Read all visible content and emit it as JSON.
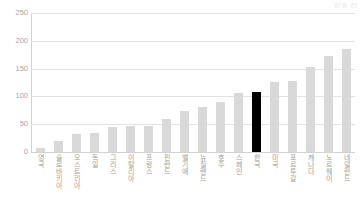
{
  "unit_note": "(단위: 건)",
  "chart_data": {
    "type": "bar",
    "title": "",
    "subtitle": "",
    "xlabel": "",
    "ylabel": "",
    "ylim": [
      0,
      250
    ],
    "yticks": [
      0,
      50,
      100,
      150,
      200,
      250
    ],
    "grid": true,
    "legend": false,
    "highlight_category": "한국",
    "colors": {
      "bar": "#d9d9d9",
      "highlight_bar": "#000000",
      "gridline": "#e3e3e3",
      "axis": "#d2d2d2",
      "tick_text": "#a6a6a6",
      "label_text": "#a0a0a0"
    },
    "categories": [
      "영국",
      "슬로바키아",
      "오스트리아",
      "독일",
      "그리스",
      "이탈리아",
      "프랑스",
      "핀란드",
      "벨기에",
      "뉴질랜드",
      "호주",
      "스페인",
      "한국",
      "미국",
      "포르투갈",
      "캐나다",
      "노르웨이",
      "네덜란드"
    ],
    "values": [
      8,
      20,
      33,
      34,
      45,
      47,
      47,
      59,
      74,
      81,
      90,
      107,
      108,
      126,
      127,
      153,
      172,
      186
    ]
  }
}
